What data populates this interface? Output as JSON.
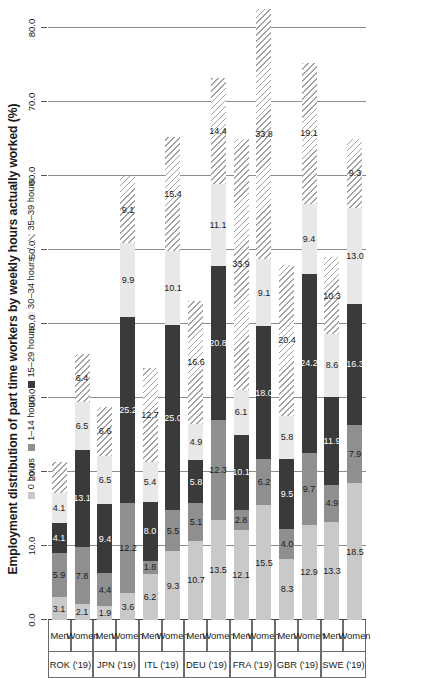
{
  "chart": {
    "title": "Employment distribution of part time workers by weekly hours actually worked (%)",
    "legend": {
      "items": [
        {
          "label": "0 hours",
          "key": "h0",
          "color": "#c9c9c9"
        },
        {
          "label": "1–14 hours",
          "key": "h1_14",
          "color": "#8f8f8f"
        },
        {
          "label": "15–29 hours",
          "key": "h15_29",
          "color": "#3a3a3a"
        },
        {
          "label": "30–34 hours",
          "key": "h30_34",
          "color": "#e8e8e8"
        },
        {
          "label": "35–39 hours",
          "key": "h35_39",
          "color": "#ffffff"
        }
      ],
      "separator": "/"
    },
    "axis_ticks": [
      "0.0",
      "10.0",
      "20.0",
      "30.0",
      "40.0",
      "50.0",
      "60.0",
      "70.0",
      "80.0"
    ],
    "sex_men": "Men",
    "sex_women": "Women"
  },
  "chart_data": {
    "type": "bar",
    "orientation": "vertical-stacked",
    "title": "Employment distribution of part time workers by weekly hours actually worked (%)",
    "xlabel": "",
    "ylabel": "",
    "ylim": [
      0,
      80
    ],
    "yticks": [
      0,
      10,
      20,
      30,
      40,
      50,
      60,
      70,
      80
    ],
    "grid": true,
    "legend_position": "top",
    "series": [
      {
        "name": "0 hours",
        "values": [
          3.1,
          2.1,
          1.9,
          3.6,
          6.2,
          9.3,
          10.7,
          13.5,
          12.1,
          15.5,
          8.3,
          12.9,
          13.3,
          18.5
        ]
      },
      {
        "name": "1–14 hours",
        "values": [
          5.9,
          7.8,
          4.4,
          12.2,
          1.8,
          5.5,
          5.1,
          13.5,
          2.8,
          6.2,
          4.0,
          9.7,
          4.9,
          7.9
        ]
      },
      {
        "name": "15–29 hours",
        "values": [
          4.1,
          13.1,
          9.4,
          25.2,
          8.0,
          25.0,
          5.8,
          20.8,
          10.1,
          18.0,
          9.5,
          24.2,
          11.9,
          16.3
        ]
      },
      {
        "name": "30–34 hours",
        "values": [
          4.1,
          6.5,
          6.5,
          9.9,
          5.4,
          10.1,
          4.9,
          11.1,
          6.1,
          9.1,
          5.8,
          9.4,
          8.6,
          13.0
        ]
      },
      {
        "name": "35–39 hours",
        "values": [
          4.1,
          6.4,
          6.6,
          9.1,
          12.7,
          15.4,
          16.6,
          14.4,
          33.9,
          33.8,
          20.4,
          19.1,
          10.3,
          9.3
        ]
      }
    ],
    "categories": [
      {
        "country": "ROK ('19)",
        "sex": "Men"
      },
      {
        "country": "ROK ('19)",
        "sex": "Women"
      },
      {
        "country": "JPN ('19)",
        "sex": "Men"
      },
      {
        "country": "JPN ('19)",
        "sex": "Women"
      },
      {
        "country": "ITL ('19)",
        "sex": "Men"
      },
      {
        "country": "ITL ('19)",
        "sex": "Women"
      },
      {
        "country": "DEU ('19)",
        "sex": "Men"
      },
      {
        "country": "DEU ('19)",
        "sex": "Women"
      },
      {
        "country": "FRA ('19)",
        "sex": "Men"
      },
      {
        "country": "FRA ('19)",
        "sex": "Women"
      },
      {
        "country": "GBR ('19)",
        "sex": "Men"
      },
      {
        "country": "GBR ('19)",
        "sex": "Women"
      },
      {
        "country": "SWE ('19)",
        "sex": "Men"
      },
      {
        "country": "SWE ('19)",
        "sex": "Women"
      }
    ],
    "groups": [
      {
        "country": "ROK ('19)",
        "rows": [
          0,
          1
        ]
      },
      {
        "country": "JPN ('19)",
        "rows": [
          2,
          3
        ]
      },
      {
        "country": "ITL ('19)",
        "rows": [
          4,
          5
        ]
      },
      {
        "country": "DEU ('19)",
        "rows": [
          6,
          7
        ]
      },
      {
        "country": "FRA ('19)",
        "rows": [
          8,
          9
        ]
      },
      {
        "country": "GBR ('19)",
        "rows": [
          10,
          11
        ]
      },
      {
        "country": "SWE ('19)",
        "rows": [
          12,
          13
        ]
      }
    ],
    "bar_labels": [
      [
        "3.1",
        "5.9",
        "4.1",
        "4.1",
        ""
      ],
      [
        "2.1",
        "7.8",
        "13.1",
        "6.5",
        "6.4"
      ],
      [
        "1.9",
        "4.4",
        "9.4",
        "6.5",
        "6.6"
      ],
      [
        "3.6",
        "12.2",
        "25.2",
        "9.9",
        "9.1"
      ],
      [
        "6.2",
        "1.8",
        "8.0",
        "5.4",
        "12.7"
      ],
      [
        "9.3",
        "5.5",
        "25.0",
        "10.1",
        "15.4"
      ],
      [
        "10.7",
        "5.1",
        "5.8",
        "4.9",
        "16.6"
      ],
      [
        "13.5",
        "12.3",
        "20.8",
        "11.1",
        "14.4"
      ],
      [
        "12.1",
        "2.8",
        "10.1",
        "6.1",
        "33.9"
      ],
      [
        "15.5",
        "6.2",
        "18.0",
        "9.1",
        "33.8"
      ],
      [
        "8.3",
        "4.0",
        "9.5",
        "5.8",
        "20.4"
      ],
      [
        "12.9",
        "9.7",
        "24.2",
        "9.4",
        "19.1"
      ],
      [
        "13.3",
        "4.9",
        "11.9",
        "8.6",
        "10.3"
      ],
      [
        "18.5",
        "7.9",
        "16.3",
        "13.0",
        "9.3"
      ]
    ]
  }
}
